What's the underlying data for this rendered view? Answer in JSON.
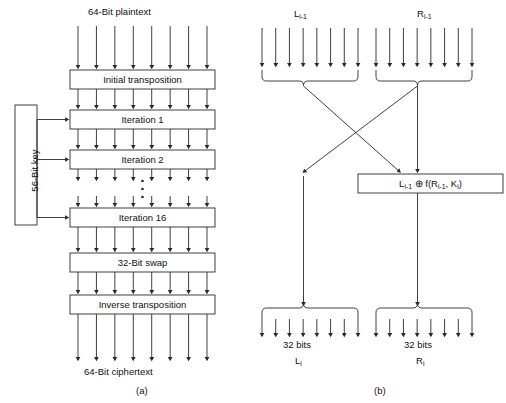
{
  "figure": {
    "title_a": "64-Bit plaintext",
    "title_b_left": "L",
    "title_b_right": "R"
  },
  "panel_a": {
    "caption": "(a)",
    "input_label": "64-Bit plaintext",
    "output_label": "64-Bit ciphertext",
    "key_label": "56-Bit key",
    "ellipsis": "•",
    "boxes": [
      {
        "label": "Initial transposition"
      },
      {
        "label": "Iteration 1"
      },
      {
        "label": "Iteration 2"
      },
      {
        "label": "Iteration 16"
      },
      {
        "label": "32-Bit swap"
      },
      {
        "label": "Inverse transposition"
      }
    ],
    "arrow_count_per_bus": 8,
    "key_arrow_targets": [
      "Iteration 1",
      "Iteration 2",
      "Iteration 16"
    ]
  },
  "panel_b": {
    "caption": "(b)",
    "top_left_label": "Li-1",
    "top_right_label": "Ri-1",
    "xor_box_label": "Li-1 ⊕ f(Ri-1, Ki)",
    "xor_box_parts": {
      "l_base": "L",
      "l_sub": "i-1",
      "op": "⊕",
      "f": "f(",
      "r_base": "R",
      "r_sub": "i-1",
      "comma": ", ",
      "k_base": "K",
      "k_sub": "i",
      "close": ")"
    },
    "bottom_left_bits": "32 bits",
    "bottom_left_name": "Li",
    "bottom_right_bits": "32 bits",
    "bottom_right_name": "Ri",
    "arrow_count_per_bus": 8
  },
  "colors": {
    "stroke": "#2a2a2a",
    "background": "#ffffff",
    "text": "#111111"
  }
}
